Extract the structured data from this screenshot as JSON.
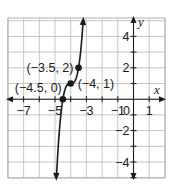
{
  "chart_data": {
    "type": "line",
    "title": "",
    "xlabel": "x",
    "ylabel": "y",
    "xlim": [
      -8,
      2
    ],
    "ylim": [
      -5,
      5.2
    ],
    "grid": true,
    "x_tick_labels": [
      {
        "value": -7,
        "text": "−7"
      },
      {
        "value": -5,
        "text": "−5"
      },
      {
        "value": -3,
        "text": "−3"
      },
      {
        "value": -1,
        "text": "−1"
      },
      {
        "value": 1,
        "text": "1"
      }
    ],
    "y_tick_labels": [
      {
        "value": 4,
        "text": "4"
      },
      {
        "value": 2,
        "text": "2"
      },
      {
        "value": -2,
        "text": "−2"
      },
      {
        "value": -4,
        "text": "−4"
      }
    ],
    "origin_label": "0",
    "function": "y = 8(x + 4)^3 + 1",
    "series": [
      {
        "name": "curve",
        "x": [
          -4.909,
          -4.8,
          -4.7,
          -4.6,
          -4.5,
          -4.4,
          -4.3,
          -4.2,
          -4.1,
          -4.0,
          -3.9,
          -3.8,
          -3.7,
          -3.6,
          -3.5,
          -3.4,
          -3.3,
          -3.206
        ],
        "y": [
          -5.0,
          -3.096,
          -1.744,
          -0.728,
          0.0,
          0.488,
          0.784,
          0.936,
          0.992,
          1.0,
          1.008,
          1.064,
          1.216,
          1.512,
          2.0,
          2.728,
          3.744,
          5.0
        ]
      }
    ],
    "points": [
      {
        "x": -4.5,
        "y": 0,
        "label": "(−4.5, 0)"
      },
      {
        "x": -4,
        "y": 1,
        "label": "(−4, 1)"
      },
      {
        "x": -3.5,
        "y": 2,
        "label": "(−3.5, 2)"
      }
    ],
    "colors": {
      "grid": "#b8b8b8",
      "axis": "#1a1a1a",
      "curve": "#1a1a1a"
    }
  }
}
